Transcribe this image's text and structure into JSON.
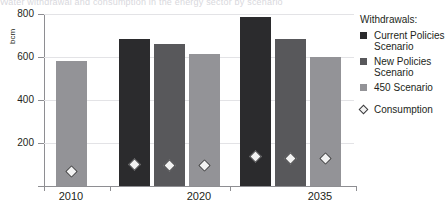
{
  "figure": {
    "title_remnant": "Water withdrawal and consumption in the energy sector by scenario"
  },
  "legend": {
    "title": "Withdrawals:",
    "items": [
      {
        "label": "Current Policies Scenario",
        "color": "#2b2b2d",
        "swatch": "legend-swatch-current-policies"
      },
      {
        "label": "New Policies Scenario",
        "color": "#58585b",
        "swatch": "legend-swatch-new-policies"
      },
      {
        "label": "450 Scenario",
        "color": "#939397",
        "swatch": "legend-swatch-450"
      }
    ],
    "marker_entry": {
      "label": "Consumption",
      "marker": "diamond"
    }
  },
  "chart_data": {
    "type": "bar",
    "title": "",
    "xlabel": "",
    "ylabel": "bcm",
    "ylim": [
      0,
      800
    ],
    "yticks": [
      200,
      400,
      600,
      800
    ],
    "ytick_labels": [
      "200",
      "400",
      "600",
      "800"
    ],
    "grid": true,
    "legend_position": "right",
    "categories": [
      "2010",
      "2020",
      "2035"
    ],
    "series": [
      {
        "name": "Current Policies Scenario",
        "color": "#2b2b2d",
        "values": [
          null,
          683,
          785
        ]
      },
      {
        "name": "New Policies Scenario",
        "color": "#58585b",
        "values": [
          null,
          661,
          686
        ]
      },
      {
        "name": "450 Scenario",
        "color": "#939397",
        "values": [
          583,
          614,
          600
        ]
      }
    ],
    "overlay": {
      "name": "Consumption",
      "marker": "diamond",
      "marker_face": "#f2f2f2",
      "marker_edge": "#3a3a3c",
      "points": [
        {
          "category": "2010",
          "series": "450 Scenario",
          "value": 66
        },
        {
          "category": "2020",
          "series": "Current Policies Scenario",
          "value": 101
        },
        {
          "category": "2020",
          "series": "New Policies Scenario",
          "value": 96
        },
        {
          "category": "2020",
          "series": "450 Scenario",
          "value": 94
        },
        {
          "category": "2035",
          "series": "Current Policies Scenario",
          "value": 138
        },
        {
          "category": "2035",
          "series": "New Policies Scenario",
          "value": 127
        },
        {
          "category": "2035",
          "series": "450 Scenario",
          "value": 130
        }
      ]
    }
  }
}
